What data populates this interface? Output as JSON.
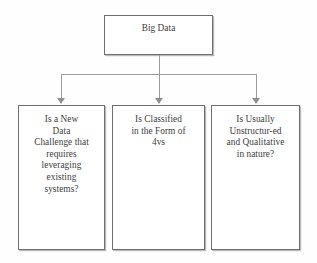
{
  "diagram": {
    "type": "flowchart",
    "orientation": "top-down",
    "root": {
      "label": "Big Data"
    },
    "children": [
      {
        "label": "Is a New\nData\nChallenge that\nrequires\nleveraging\nexisting\nsystems?"
      },
      {
        "label": "Is Classified\nin the Form of\n4vs"
      },
      {
        "label": "Is Usually\nUnstructur-ed\nand Qualitative\nin nature?"
      }
    ],
    "colors": {
      "background": "#fefefe",
      "box_border": "#6f6f6f",
      "box_fill": "#ffffff",
      "connector": "#9b9b9b",
      "arrowhead": "#8f8f8f",
      "text": "#3d3d3d"
    }
  }
}
